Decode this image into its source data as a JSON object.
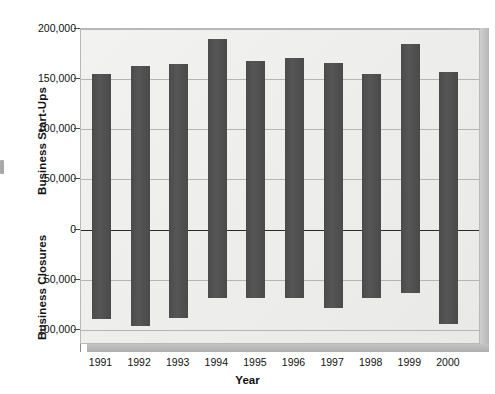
{
  "chart_data": {
    "type": "bar",
    "title": "",
    "xlabel": "Year",
    "ylabel_top": "Business Start-Ups",
    "ylabel_bottom": "Business Closures",
    "categories": [
      "1991",
      "1992",
      "1993",
      "1994",
      "1995",
      "1996",
      "1997",
      "1998",
      "1999",
      "2000"
    ],
    "y_tick_labels": [
      "200,000",
      "150,000",
      "100,000",
      "50,000",
      "0",
      "50,000",
      "100,000"
    ],
    "y_tick_values": [
      200000,
      150000,
      100000,
      50000,
      0,
      -50000,
      -100000
    ],
    "ylim": [
      -115000,
      200000
    ],
    "grid": true,
    "legend": "none",
    "bar_color": "#4e4e4e",
    "plot_background": "#eeeeec",
    "series": [
      {
        "name": "Business Start-Ups",
        "direction": "up",
        "values": [
          155000,
          163000,
          165000,
          190000,
          168000,
          171000,
          166000,
          155000,
          185000,
          157000
        ]
      },
      {
        "name": "Business Closures",
        "direction": "down",
        "values": [
          89000,
          96000,
          88000,
          68000,
          68000,
          68000,
          78000,
          68000,
          63000,
          94000
        ]
      }
    ]
  },
  "axis": {
    "x_title": "Year",
    "y_title_upper": "Business Start-Ups",
    "y_title_lower": "Business Closures"
  }
}
